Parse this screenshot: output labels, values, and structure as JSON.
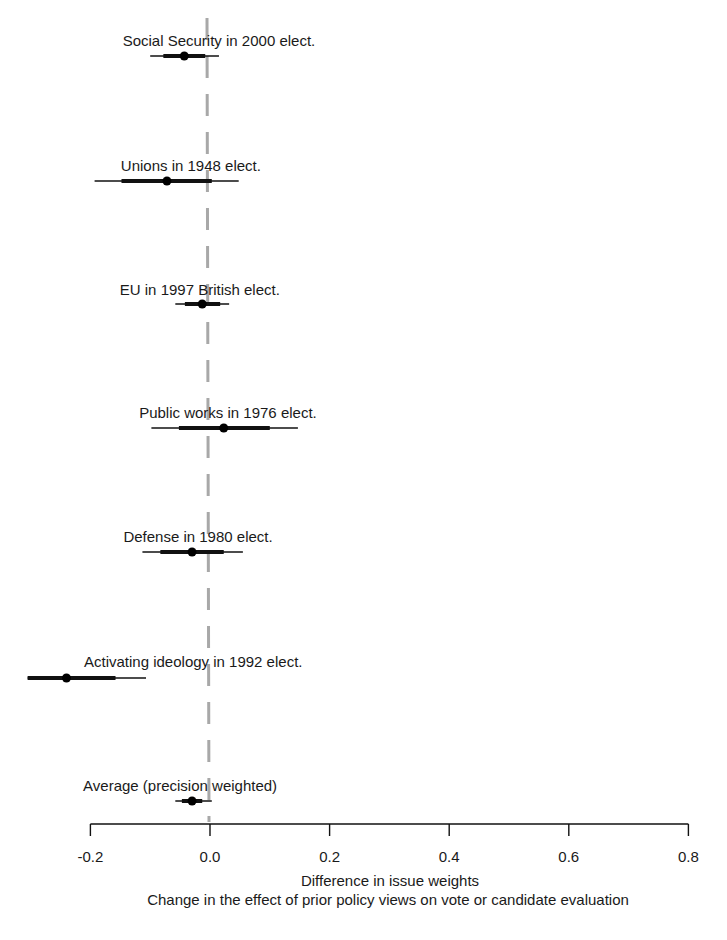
{
  "chart_data": {
    "type": "scatter",
    "subtype": "coefficient-plot",
    "title": "",
    "xlabel": "Difference in issue weights",
    "xlabel2": "Change in the effect of prior policy views on vote or candidate evaluation",
    "ylabel": "",
    "xlim": [
      -0.2,
      0.8
    ],
    "xticks": [
      -0.2,
      0.0,
      0.2,
      0.4,
      0.6,
      0.8
    ],
    "xtick_labels": [
      "-0.2",
      "0.0",
      "0.2",
      "0.4",
      "0.6",
      "0.8"
    ],
    "reference_line": {
      "x": 0.0,
      "style": "dashed",
      "color": "#a0a0a0"
    },
    "grid": false,
    "legend": null,
    "series": [
      {
        "name": "Social Security in 2000 elect.",
        "estimate": -0.043,
        "ci_inner": [
          -0.078,
          -0.008
        ],
        "ci_outer": [
          -0.1,
          0.015
        ],
        "label_x": 0.015
      },
      {
        "name": "Unions in 1948 elect.",
        "estimate": -0.072,
        "ci_inner": [
          -0.148,
          0.003
        ],
        "ci_outer": [
          -0.193,
          0.048
        ],
        "label_x": -0.032
      },
      {
        "name": "EU in 1997 British elect.",
        "estimate": -0.013,
        "ci_inner": [
          -0.042,
          0.017
        ],
        "ci_outer": [
          -0.058,
          0.032
        ],
        "label_x": -0.017
      },
      {
        "name": "Public works in 1976 elect.",
        "estimate": 0.023,
        "ci_inner": [
          -0.052,
          0.1
        ],
        "ci_outer": [
          -0.098,
          0.147
        ],
        "label_x": 0.03
      },
      {
        "name": "Defense in 1980 elect.",
        "estimate": -0.03,
        "ci_inner": [
          -0.083,
          0.023
        ],
        "ci_outer": [
          -0.113,
          0.055
        ],
        "label_x": -0.02
      },
      {
        "name": "Activating ideology in 1992 elect.",
        "estimate": -0.24,
        "ci_inner": [
          -0.305,
          -0.158
        ],
        "ci_outer": [
          -0.305,
          -0.107
        ],
        "label_x": -0.028
      },
      {
        "name": "Average (precision weighted)",
        "estimate": -0.03,
        "ci_inner": [
          -0.047,
          -0.013
        ],
        "ci_outer": [
          -0.058,
          0.003
        ],
        "label_x": -0.05
      }
    ]
  },
  "layout": {
    "x0_px": 210,
    "px_per_unit": 598,
    "axis_y": 824,
    "row_y": [
      56,
      181,
      304,
      428,
      552,
      678,
      801
    ],
    "label_y": [
      41,
      166,
      290,
      413,
      537,
      662,
      786
    ]
  }
}
